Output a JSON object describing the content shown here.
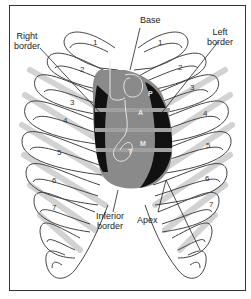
{
  "diagram": {
    "labels": {
      "base": "Base",
      "right_border": "Right\nborder",
      "right_border_line1": "Right",
      "right_border_line2": "border",
      "left_border_line1": "Left",
      "left_border_line2": "border",
      "inferior_border_line1": "Inferior",
      "inferior_border_line2": "border",
      "apex": "Apex"
    },
    "valves": [
      "P",
      "A",
      "M",
      "T"
    ],
    "rib_numbers_left": [
      "1",
      "2",
      "3",
      "4",
      "5",
      "6",
      "7"
    ],
    "rib_numbers_right": [
      "1",
      "2",
      "3",
      "4",
      "5",
      "6",
      "7"
    ],
    "colors": {
      "heart_dark": "#111111",
      "heart_gray": "#8a8a8a",
      "rib_outline": "#444444",
      "rib_shadow": "#cfcfcf",
      "frame": "#333333"
    }
  }
}
